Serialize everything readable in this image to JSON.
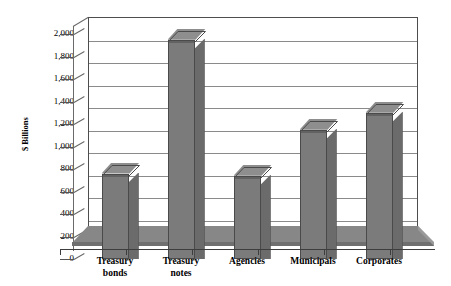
{
  "chart_data": {
    "type": "bar",
    "title": "",
    "subtitle": "",
    "xlabel": "",
    "ylabel": "$ Billions",
    "categories": [
      "Treasury\nbonds",
      "Treasury\nnotes",
      "Agencies",
      "Municipals",
      "Corporates"
    ],
    "values": [
      760,
      1950,
      740,
      1150,
      1300
    ],
    "ylim": [
      0,
      2000
    ],
    "ytick_values": [
      0,
      200,
      400,
      600,
      800,
      1000,
      1200,
      1400,
      1600,
      1800,
      2000
    ],
    "ytick_labels": [
      "0",
      "200",
      "400",
      "600",
      "800",
      "1,000",
      "1,200",
      "1,400",
      "1,600",
      "1,800",
      "2,000"
    ],
    "grid": true,
    "legend": false,
    "legend_position": "none",
    "style": "3d-column",
    "colors": {
      "bar_front": "#7b7b7b",
      "bar_side": "#6b6b6b",
      "bar_top": "#8e8e8e",
      "bar_outline": "#4a4a4a",
      "floor": "#878787",
      "gridline": "#8a8a8a",
      "axis": "#4d4d4d",
      "background": "#ffffff",
      "text": "#000000"
    }
  },
  "axes": {
    "y_title": "$ Billions"
  }
}
